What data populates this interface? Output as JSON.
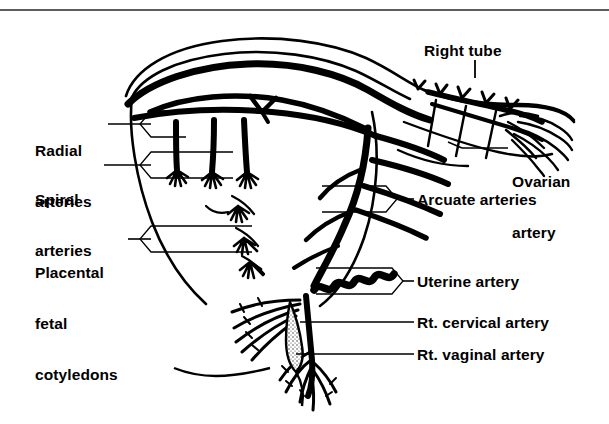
{
  "figure": {
    "domain_kind": "anatomical-line-diagram",
    "background_color": "#ffffff",
    "ink_color": "#000000",
    "rule_color": "#5d5d5d",
    "canvas": {
      "width": 609,
      "height": 424
    }
  },
  "labels": {
    "radial_arteries": {
      "line1": "Radial",
      "line2": "arteries"
    },
    "spiral_arteries": {
      "line1": "Spiral",
      "line2": "arteries"
    },
    "placental_cotyledons": {
      "line1": "Placental",
      "line2": "fetal",
      "line3": "cotyledons"
    },
    "right_tube": {
      "text": "Right tube"
    },
    "ovarian_artery": {
      "line1": "Ovarian",
      "line2": "artery"
    },
    "arcuate_arteries": {
      "text": "Arcuate arteries"
    },
    "uterine_artery": {
      "text": "Uterine artery"
    },
    "rt_cervical_artery": {
      "text": "Rt. cervical artery"
    },
    "rt_vaginal_artery": {
      "text": "Rt. vaginal artery"
    }
  },
  "callouts": [
    {
      "name": "radial-arteries-banner",
      "direction": "left-point",
      "target": "radial arteries descending into myometrium"
    },
    {
      "name": "spiral-arteries-banner",
      "direction": "left-point",
      "target": "spiral arteries / tufted endings"
    },
    {
      "name": "placental-cotyledons-banner",
      "direction": "left-point",
      "target": "placental fetal cotyledons"
    },
    {
      "name": "arcuate-arteries-banner",
      "direction": "right-point",
      "target": "arcuate arteries in uterine wall"
    },
    {
      "name": "uterine-artery-banner",
      "direction": "right-point",
      "target": "coiled uterine artery"
    },
    {
      "name": "rt-cervical-artery-leader",
      "direction": "plain-line",
      "target": "right cervical artery"
    },
    {
      "name": "rt-vaginal-artery-leader",
      "direction": "plain-line",
      "target": "right vaginal artery"
    },
    {
      "name": "right-tube-leader",
      "direction": "tick-down",
      "target": "right uterine tube"
    },
    {
      "name": "ovarian-artery-leader",
      "direction": "plain-line",
      "target": "ovarian artery at ovary"
    }
  ],
  "structures": [
    "uterine fundus dome",
    "myometrial wall",
    "arcuate artery network",
    "radial arteries",
    "spiral arteries with tufted terminals",
    "placental cotyledons",
    "right uterine tube",
    "ovary with fimbriae",
    "ovarian artery",
    "uterine artery (coiled segment)",
    "cervix",
    "vagina with vaginal branches"
  ]
}
